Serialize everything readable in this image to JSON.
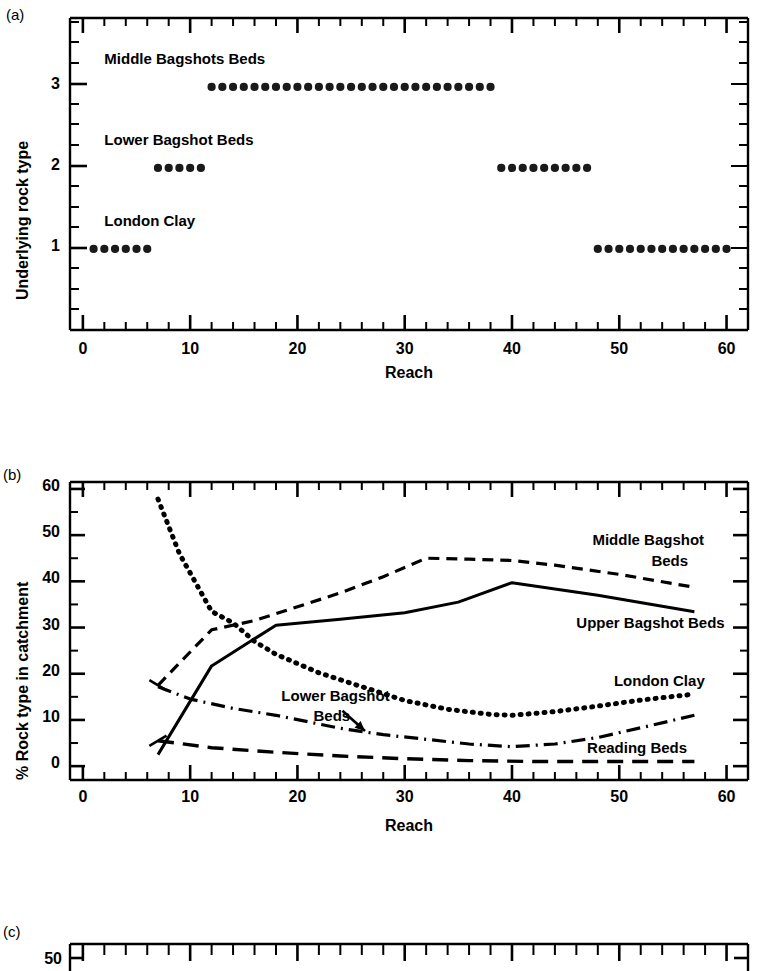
{
  "figure": {
    "panels": [
      {
        "tag": "(a)",
        "ylabel": "Underlying rock type",
        "xlabel": "Reach",
        "annotations": [
          {
            "text": "Middle Bagshots Beds"
          },
          {
            "text": "Lower Bagshot Beds"
          },
          {
            "text": "London Clay"
          }
        ]
      },
      {
        "tag": "(b)",
        "ylabel": "% Rock type  in catchment",
        "xlabel": "Reach",
        "annotations": [
          {
            "text": "Middle Bagshot"
          },
          {
            "text": "Beds"
          },
          {
            "text": "Upper Bagshot Beds"
          },
          {
            "text": "London Clay"
          },
          {
            "text": "Lower Bagshot"
          },
          {
            "text": "Beds"
          },
          {
            "text": "Reading Beds"
          }
        ]
      },
      {
        "tag": "(c)",
        "ylabel": "",
        "xlabel": "",
        "annotations": []
      }
    ]
  },
  "chart_data": [
    {
      "type": "scatter",
      "panel": "a",
      "title": "",
      "xlabel": "Reach",
      "ylabel": "Underlying rock type",
      "xlim": [
        -1.2,
        62
      ],
      "ylim": [
        0,
        3.85
      ],
      "xticks": [
        0,
        10,
        20,
        30,
        40,
        50,
        60
      ],
      "xtick_labels": [
        "0",
        "10",
        "20",
        "30",
        "40",
        "50",
        "60"
      ],
      "xminor_step": 2,
      "yticks": [
        1,
        2,
        3
      ],
      "ytick_labels": [
        "1",
        "2",
        "3"
      ],
      "yminor_step": 0.25,
      "grid": false,
      "legend": "none",
      "series": [
        {
          "name": "London Clay",
          "y": 1,
          "x": [
            1,
            2,
            3,
            4,
            5,
            6
          ]
        },
        {
          "name": "Lower Bagshot Beds",
          "y": 2,
          "x": [
            7,
            8,
            9,
            10,
            11
          ]
        },
        {
          "name": "Middle Bagshots Beds",
          "y": 3,
          "x": [
            12,
            13,
            14,
            15,
            16,
            17,
            18,
            19,
            20,
            21,
            22,
            23,
            24,
            25,
            26,
            27,
            28,
            29,
            30,
            31,
            32,
            33,
            34,
            35,
            36,
            37,
            38
          ]
        },
        {
          "name": "Lower Bagshot Beds (second)",
          "y": 2,
          "x": [
            39,
            40,
            41,
            42,
            43,
            44,
            45,
            46,
            47
          ]
        },
        {
          "name": "London Clay (second)",
          "y": 1,
          "x": [
            48,
            49,
            50,
            51,
            52,
            53,
            54,
            55,
            56,
            57,
            58,
            59,
            60
          ]
        }
      ],
      "annotations": [
        {
          "text": "Middle Bagshots Beds",
          "x": 2.0,
          "y": 3.32
        },
        {
          "text": "Lower Bagshot Beds",
          "x": 2.0,
          "y": 2.32
        },
        {
          "text": "London Clay",
          "x": 2.0,
          "y": 1.32
        }
      ]
    },
    {
      "type": "line",
      "panel": "b",
      "title": "",
      "xlabel": "Reach",
      "ylabel": "% Rock type  in catchment",
      "xlim": [
        -1.2,
        62
      ],
      "ylim": [
        -3,
        61.5
      ],
      "xticks": [
        0,
        10,
        20,
        30,
        40,
        50,
        60
      ],
      "xtick_labels": [
        "0",
        "10",
        "20",
        "30",
        "40",
        "50",
        "60"
      ],
      "xminor_step": 2,
      "yticks": [
        0,
        10,
        20,
        30,
        40,
        50,
        60
      ],
      "ytick_labels": [
        "0",
        "10",
        "20",
        "30",
        "40",
        "50",
        "60"
      ],
      "yminor_step": 5,
      "grid": false,
      "legend": "inline-labels",
      "series": [
        {
          "name": "Middle Bagshot Beds",
          "style": "dashed",
          "x": [
            7,
            12,
            16,
            18,
            24,
            28,
            32,
            36,
            40,
            44,
            50,
            57
          ],
          "y": [
            17.5,
            29.5,
            31.5,
            33.0,
            37.5,
            41.0,
            45.0,
            44.8,
            44.5,
            43.5,
            41.5,
            38.7
          ]
        },
        {
          "name": "Upper Bagshot Beds",
          "style": "solid",
          "x": [
            7,
            12,
            18,
            24,
            30,
            35,
            40,
            48,
            57
          ],
          "y": [
            2.5,
            21.7,
            30.5,
            31.8,
            33.2,
            35.5,
            39.7,
            37.0,
            33.4
          ]
        },
        {
          "name": "London Clay",
          "style": "dotted",
          "x": [
            7,
            9,
            12,
            14,
            16,
            18,
            22,
            26,
            30,
            34,
            38,
            40,
            44,
            48,
            52,
            57
          ],
          "y": [
            57.8,
            46.0,
            33.5,
            31.0,
            27.0,
            24.2,
            20.2,
            17.2,
            14.2,
            12.3,
            11.2,
            11.0,
            11.8,
            13.0,
            14.3,
            15.6
          ]
        },
        {
          "name": "Lower Bagshot Beds",
          "style": "dashdot",
          "x": [
            7,
            10,
            14,
            18,
            24,
            28,
            32,
            36,
            40,
            44,
            48,
            52,
            57
          ],
          "y": [
            17.2,
            14.5,
            12.5,
            11.0,
            8.2,
            6.8,
            5.8,
            4.8,
            4.2,
            4.8,
            6.2,
            8.3,
            11.0
          ]
        },
        {
          "name": "Reading Beds",
          "style": "longdash",
          "x": [
            7,
            12,
            18,
            24,
            30,
            36,
            42,
            48,
            54,
            57
          ],
          "y": [
            5.5,
            4.0,
            3.0,
            2.2,
            1.6,
            1.2,
            1.0,
            1.0,
            1.0,
            1.0
          ]
        }
      ],
      "annotations": [
        {
          "text": "Middle Bagshot",
          "x": 47.5,
          "y": 48.5
        },
        {
          "text": "Beds",
          "x": 53.0,
          "y": 44.0
        },
        {
          "text": "Upper Bagshot Beds",
          "x": 46.0,
          "y": 30.5
        },
        {
          "text": "London Clay",
          "x": 49.5,
          "y": 18.0
        },
        {
          "text": "Lower Bagshot",
          "x": 18.5,
          "y": 14.8
        },
        {
          "text": "Beds",
          "x": 21.5,
          "y": 10.5
        },
        {
          "text": "Reading Beds",
          "x": 47.0,
          "y": 3.6
        }
      ],
      "arrow": {
        "from_x": 24.2,
        "from_y": 12.0,
        "to_x": 26.3,
        "to_y": 7.6
      }
    },
    {
      "type": "line",
      "panel": "c",
      "title": "",
      "xlabel": "",
      "ylabel": "",
      "note": "panel cropped by screenshot bottom edge",
      "yticks": [
        50
      ],
      "ytick_labels": [
        "50"
      ],
      "xminor_step": 2,
      "grid": false,
      "legend": "none",
      "series": []
    }
  ]
}
